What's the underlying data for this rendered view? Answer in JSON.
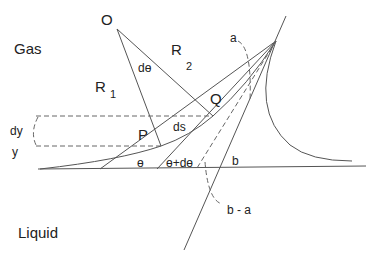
{
  "diagram": {
    "type": "geometry",
    "regions": {
      "upper": "Gas",
      "lower": "Liquid"
    },
    "points": {
      "center": "O",
      "p1": "P",
      "p2": "Q"
    },
    "radii": {
      "r1": "R",
      "r1_sub": "1",
      "r2": "R",
      "r2_sub": "2"
    },
    "labels": {
      "d_theta_top": "dө",
      "ds": "ds",
      "dy": "dy",
      "y": "y",
      "theta": "ө",
      "theta_plus": "ө+dө",
      "a": "a",
      "b": "b",
      "b_minus_a": "b - a"
    },
    "colors": {
      "line": "#555555",
      "text": "#222222",
      "background": "#ffffff"
    }
  }
}
